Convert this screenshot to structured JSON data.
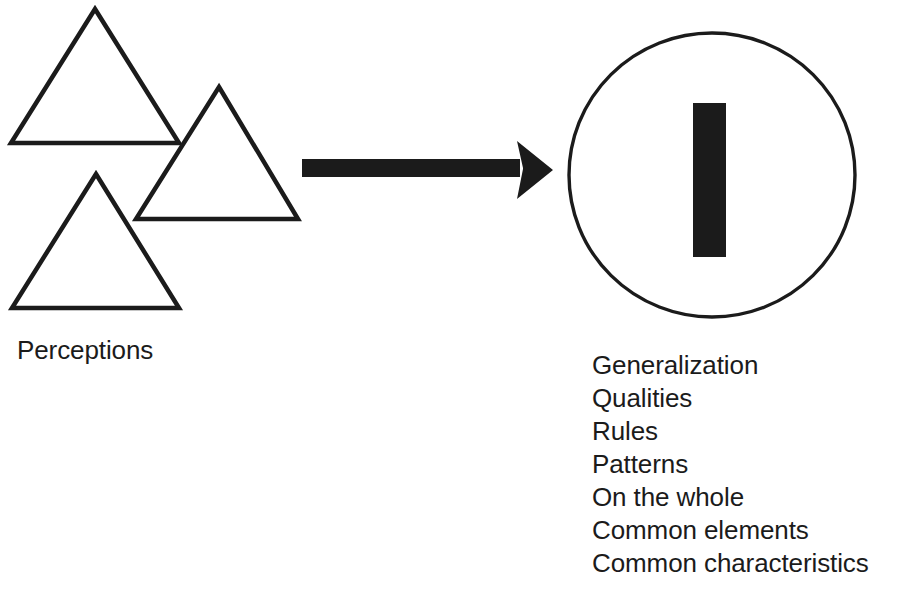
{
  "diagram": {
    "background_color": "#ffffff",
    "ink_color": "#1b1b1b",
    "left_group": {
      "label": "Perceptions",
      "shape_icon_name": "triangle-outline",
      "shape_count": 3,
      "shapes": [
        {
          "name": "triangle-large-top-left",
          "apex_x": 95,
          "apex_y": 9,
          "base_left_x": 11,
          "base_right_x": 179,
          "base_y": 143
        },
        {
          "name": "triangle-middle-right",
          "apex_x": 219,
          "apex_y": 87,
          "base_left_x": 136,
          "base_right_x": 298,
          "base_y": 219
        },
        {
          "name": "triangle-bottom-left",
          "apex_x": 96,
          "apex_y": 174,
          "base_left_x": 12,
          "base_right_x": 179,
          "base_y": 308
        }
      ]
    },
    "connector": {
      "icon_name": "right-arrow",
      "direction": "right",
      "shaft_start_x": 302,
      "shaft_end_x": 520,
      "shaft_top_y": 159,
      "shaft_bottom_y": 177,
      "head_tip_x": 553,
      "head_back_x": 517,
      "head_top_y": 141,
      "head_bottom_y": 199
    },
    "right_group": {
      "shape_icon_name": "circle-outline",
      "circle": {
        "center_x": 712,
        "center_y": 175,
        "radius_x": 144,
        "radius_y": 143,
        "stroke_width": 3
      },
      "inner_shape_icon_name": "vertical-bar-solid",
      "inner_bar": {
        "x": 693,
        "y": 103,
        "width": 33,
        "height": 154
      },
      "items": [
        "Generalization",
        "Qualities",
        "Rules",
        "Patterns",
        "On the whole",
        "Common elements",
        "Common characteristics"
      ]
    }
  }
}
